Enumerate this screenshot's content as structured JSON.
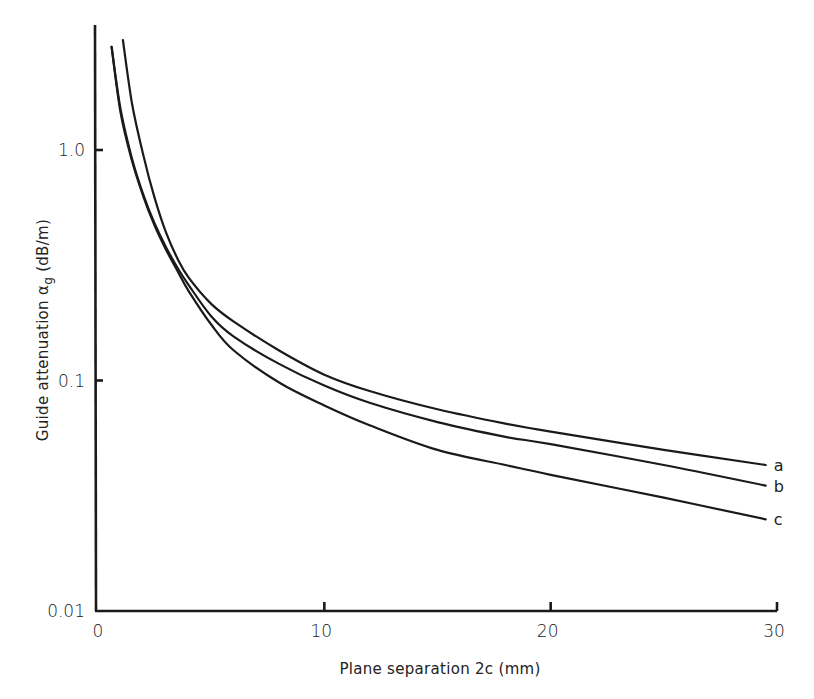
{
  "chart_data": {
    "type": "line",
    "title": "",
    "xlabel": "Plane separation 2c (mm)",
    "ylabel": "Guide attenuation αg (dB/m)",
    "ylabel_main": "Guide attenuation α",
    "ylabel_sub": "g",
    "ylabel_unit": " (dB/m)",
    "xscale": "linear",
    "yscale": "log",
    "xlim": [
      0,
      30
    ],
    "ylim": [
      0.01,
      3.5
    ],
    "grid": false,
    "legend": "inline labels at right end of curves",
    "x_ticks": [
      0,
      10,
      20,
      30
    ],
    "x_tick_labels": [
      "0",
      "10",
      "20",
      "30"
    ],
    "y_ticks": [
      0.01,
      0.1,
      1.0
    ],
    "y_tick_labels": [
      "0.01",
      "0.1",
      "1.0"
    ],
    "series": [
      {
        "name": "a",
        "x": [
          1.1,
          1.5,
          2.0,
          2.5,
          3.0,
          3.5,
          4.0,
          5.0,
          6.0,
          8.0,
          10.0,
          12.0,
          15.0,
          18.0,
          20.0,
          25.0,
          29.5
        ],
        "values": [
          3.0,
          1.6,
          0.95,
          0.62,
          0.44,
          0.34,
          0.28,
          0.215,
          0.18,
          0.135,
          0.106,
          0.09,
          0.075,
          0.065,
          0.06,
          0.05,
          0.043
        ]
      },
      {
        "name": "b",
        "x": [
          0.6,
          1.0,
          1.5,
          2.0,
          2.5,
          3.0,
          3.5,
          4.0,
          5.0,
          6.0,
          8.0,
          10.0,
          12.0,
          15.0,
          18.0,
          20.0,
          25.0,
          29.5
        ],
        "values": [
          2.8,
          1.5,
          0.92,
          0.64,
          0.48,
          0.38,
          0.31,
          0.26,
          0.19,
          0.155,
          0.118,
          0.095,
          0.08,
          0.066,
          0.057,
          0.053,
          0.043,
          0.035
        ]
      },
      {
        "name": "c",
        "x": [
          0.6,
          1.0,
          1.5,
          2.0,
          2.5,
          3.0,
          3.5,
          4.0,
          5.0,
          6.0,
          8.0,
          10.0,
          12.0,
          15.0,
          18.0,
          20.0,
          25.0,
          29.5
        ],
        "values": [
          2.8,
          1.45,
          0.9,
          0.63,
          0.47,
          0.37,
          0.3,
          0.245,
          0.175,
          0.135,
          0.098,
          0.078,
          0.064,
          0.05,
          0.043,
          0.039,
          0.031,
          0.025
        ]
      }
    ]
  }
}
